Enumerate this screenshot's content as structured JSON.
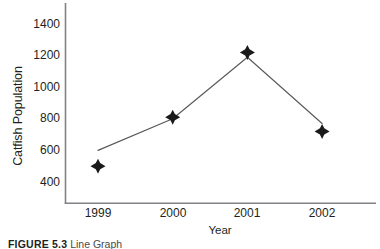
{
  "chart_data": {
    "type": "line",
    "title": "",
    "xlabel": "Year",
    "ylabel": "Catfish Population",
    "categories": [
      "1999",
      "2000",
      "2001",
      "2002"
    ],
    "x": [
      1999,
      2000,
      2001,
      2002
    ],
    "values": [
      500,
      810,
      1220,
      720
    ],
    "series": [
      {
        "name": "Catfish Population",
        "values": [
          500,
          810,
          1220,
          720
        ],
        "marker": "diamond",
        "marker_color": "#1a1a1a",
        "line_color": "#58595b"
      }
    ],
    "line_path_values": [
      600,
      800,
      1190,
      770
    ],
    "xlim": [
      1998.55,
      2002.6
    ],
    "ylim": [
      330,
      1480
    ],
    "yticks": [
      400,
      600,
      800,
      1000,
      1200,
      1400
    ],
    "ytick_labels": [
      "400",
      "600",
      "800",
      "1000",
      "1200",
      "1400"
    ],
    "xticks": [
      1999,
      2000,
      2001,
      2002
    ],
    "xtick_labels": [
      "1999",
      "2000",
      "2001",
      "2002"
    ],
    "grid": false,
    "legend": false,
    "axis_color": "#808285",
    "text_color": "#231f20"
  },
  "caption": {
    "label": "FIGURE 5.3",
    "text": "Line Graph"
  }
}
